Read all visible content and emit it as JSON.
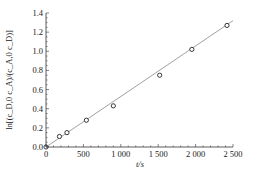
{
  "chart_data": {
    "type": "scatter",
    "title": "",
    "xlabel": "t/s",
    "ylabel": "ln[(c_D,0 c_A)/(c_A,0 c_D)]",
    "xlim": [
      0,
      2500
    ],
    "ylim": [
      0,
      1.4
    ],
    "x_ticks": [
      0,
      500,
      1000,
      1500,
      2000,
      2500
    ],
    "x_tick_labels": [
      "0",
      "500",
      "1 000",
      "1 500",
      "2 000",
      "2 500"
    ],
    "y_ticks": [
      0.0,
      0.2,
      0.4,
      0.6,
      0.8,
      1.0,
      1.2,
      1.4
    ],
    "y_tick_labels": [
      "0.0",
      "0.2",
      "0.4",
      "0.6",
      "0.8",
      "1.0",
      "1.2",
      "1.4"
    ],
    "grid": false,
    "legend": null,
    "series": [
      {
        "name": "measured",
        "marker": "open-circle",
        "x": [
          0,
          180,
          280,
          540,
          900,
          1520,
          1950,
          2420
        ],
        "y": [
          0.0,
          0.11,
          0.15,
          0.28,
          0.43,
          0.75,
          1.02,
          1.27
        ]
      },
      {
        "name": "linear fit",
        "line": "solid",
        "x": [
          0,
          2500
        ],
        "y": [
          0.0,
          1.32
        ]
      }
    ]
  },
  "colors": {
    "axis": "#333333",
    "marker": "#222222",
    "fit_line": "#888888"
  }
}
